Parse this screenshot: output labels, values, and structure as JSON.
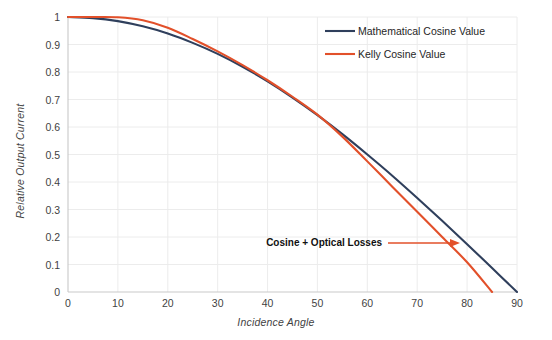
{
  "chart_data": {
    "type": "line",
    "title": "",
    "xlabel": "Incidence Angle",
    "ylabel": "Relative Output Current",
    "xlim": [
      0,
      90
    ],
    "ylim": [
      0,
      1
    ],
    "grid": true,
    "legend_position": "top-right",
    "x_ticks": [
      "0",
      "10",
      "20",
      "30",
      "40",
      "50",
      "60",
      "70",
      "80",
      "90"
    ],
    "y_ticks": [
      "0",
      "0.1",
      "0.2",
      "0.3",
      "0.4",
      "0.5",
      "0.6",
      "0.7",
      "0.8",
      "0.9",
      "1"
    ],
    "x": [
      0,
      5,
      10,
      15,
      20,
      25,
      30,
      35,
      40,
      45,
      50,
      55,
      60,
      65,
      70,
      75,
      80,
      85,
      90
    ],
    "series": [
      {
        "name": "Mathematical Cosine Value",
        "color": "#2f3f5c",
        "values": [
          1.0,
          0.996,
          0.985,
          0.966,
          0.94,
          0.906,
          0.866,
          0.819,
          0.766,
          0.707,
          0.643,
          0.574,
          0.5,
          0.423,
          0.342,
          0.259,
          0.174,
          0.087,
          0.0
        ]
      },
      {
        "name": "Kelly Cosine Value",
        "color": "#e2502a",
        "values": [
          1.0,
          1.0,
          0.999,
          0.988,
          0.961,
          0.92,
          0.875,
          0.825,
          0.77,
          0.71,
          0.645,
          0.565,
          0.475,
          0.383,
          0.292,
          0.2,
          0.108,
          0.0,
          null
        ]
      }
    ],
    "annotations": [
      {
        "text": "Cosine + Optical Losses",
        "arrow": true,
        "color": "#e2502a"
      }
    ]
  },
  "legend": {
    "items": [
      {
        "label": "Mathematical Cosine Value",
        "color": "#2f3f5c"
      },
      {
        "label": "Kelly Cosine Value",
        "color": "#e2502a"
      }
    ]
  }
}
